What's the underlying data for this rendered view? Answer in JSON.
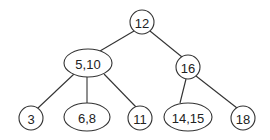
{
  "diagram": {
    "type": "tree",
    "nodes": [
      {
        "id": "n12",
        "label": "12",
        "shape": "circle",
        "cx": 142,
        "cy": 22,
        "rx": 12,
        "ry": 12
      },
      {
        "id": "n5_10",
        "label": "5,10",
        "shape": "ellipse",
        "cx": 88,
        "cy": 63,
        "rx": 24,
        "ry": 14
      },
      {
        "id": "n16",
        "label": "16",
        "shape": "circle",
        "cx": 188,
        "cy": 67,
        "rx": 12,
        "ry": 12
      },
      {
        "id": "n3",
        "label": "3",
        "shape": "circle",
        "cx": 31,
        "cy": 118,
        "rx": 12,
        "ry": 12
      },
      {
        "id": "n6_8",
        "label": "6,8",
        "shape": "ellipse",
        "cx": 87,
        "cy": 117,
        "rx": 23,
        "ry": 14
      },
      {
        "id": "n11",
        "label": "11",
        "shape": "circle",
        "cx": 140,
        "cy": 118,
        "rx": 12,
        "ry": 12
      },
      {
        "id": "n14_15",
        "label": "14,15",
        "shape": "ellipse",
        "cx": 188,
        "cy": 117,
        "rx": 24,
        "ry": 14
      },
      {
        "id": "n18",
        "label": "18",
        "shape": "circle",
        "cx": 243,
        "cy": 118,
        "rx": 12,
        "ry": 12
      }
    ],
    "edges": [
      {
        "from": "n12",
        "to": "n5_10",
        "x1": 134,
        "y1": 31,
        "x2": 100,
        "y2": 51
      },
      {
        "from": "n12",
        "to": "n16",
        "x1": 150,
        "y1": 31,
        "x2": 182,
        "y2": 57
      },
      {
        "from": "n5_10",
        "to": "n3",
        "x1": 74,
        "y1": 74,
        "x2": 38,
        "y2": 108
      },
      {
        "from": "n5_10",
        "to": "n6_8",
        "x1": 87,
        "y1": 77,
        "x2": 87,
        "y2": 103
      },
      {
        "from": "n5_10",
        "to": "n11",
        "x1": 104,
        "y1": 74,
        "x2": 136,
        "y2": 107
      },
      {
        "from": "n16",
        "to": "n14_15",
        "x1": 186,
        "y1": 79,
        "x2": 180,
        "y2": 103
      },
      {
        "from": "n16",
        "to": "n18",
        "x1": 196,
        "y1": 76,
        "x2": 237,
        "y2": 108
      }
    ]
  }
}
